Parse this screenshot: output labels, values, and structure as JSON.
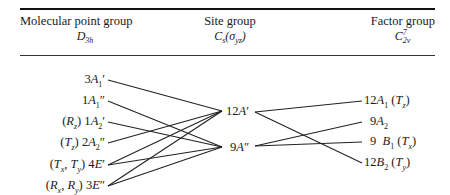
{
  "header": {
    "left": {
      "title": "Molecular point group",
      "symbol": "D3h"
    },
    "middle": {
      "title": "Site group",
      "symbol": "Cs(σyz)"
    },
    "right": {
      "title": "Factor group",
      "symbol": "C2v^7"
    }
  },
  "molecular_species": [
    {
      "activity": "",
      "label": "3A1'",
      "y": 79
    },
    {
      "activity": "",
      "label": "1A1''",
      "y": 100
    },
    {
      "activity": "(Rz)",
      "label": "1A2'",
      "y": 121
    },
    {
      "activity": "(Tz)",
      "label": "2A2''",
      "y": 142
    },
    {
      "activity": "(Tx, Ty)",
      "label": "4E'",
      "y": 164
    },
    {
      "activity": "(Rx, Ry)",
      "label": "3E''",
      "y": 185
    }
  ],
  "site_species": [
    {
      "label": "12A'",
      "y": 111
    },
    {
      "label": "9A''",
      "y": 147
    }
  ],
  "factor_species": [
    {
      "label": "12A1",
      "activity": "(Tz)",
      "y": 100
    },
    {
      "label": "9A2",
      "activity": "",
      "y": 121
    },
    {
      "label": "9 B1",
      "activity": "(Tx)",
      "y": 141
    },
    {
      "label": "12B2",
      "activity": "(Ty)",
      "y": 162
    }
  ],
  "correlations_left_to_site": [
    [
      "3A1'",
      "12A'"
    ],
    [
      "1A1''",
      "9A''"
    ],
    [
      "1A2'",
      "9A''"
    ],
    [
      "2A2''",
      "12A'"
    ],
    [
      "4E'",
      "12A'"
    ],
    [
      "4E'",
      "9A''"
    ],
    [
      "3E''",
      "12A'"
    ],
    [
      "3E''",
      "9A''"
    ]
  ],
  "correlations_site_to_factor": [
    [
      "12A'",
      "12A1"
    ],
    [
      "12A'",
      "12B2"
    ],
    [
      "9A''",
      "9A2"
    ],
    [
      "9A''",
      "9 B1"
    ]
  ]
}
